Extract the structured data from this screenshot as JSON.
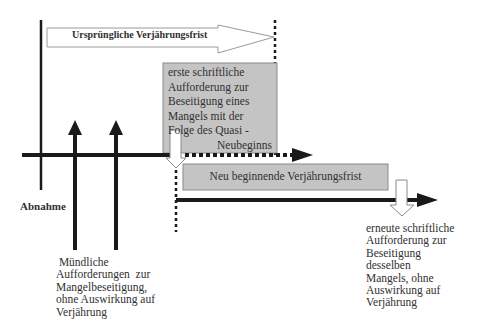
{
  "diagram": {
    "original_period": {
      "label": "Ursprüngliche Verjährungsfrist"
    },
    "first_written_request": {
      "lines": [
        "erste   schriftliche",
        "Aufforderung zur",
        "Beseitigung eines",
        "Mangels mit der",
        "Folge des Quasi -",
        "Neubeginns"
      ]
    },
    "new_period": {
      "label": "Neu beginnende Verjährungsfrist"
    },
    "acceptance": {
      "label": "Abnahme"
    },
    "oral_requests": {
      "lines": [
        " Mündliche",
        "Aufforderungen  zur",
        "Mangelbeseitigung,",
        "ohne Auswirkung auf",
        "Verjährung"
      ]
    },
    "repeated_written_request": {
      "lines": [
        "erneute schriftliche",
        "Aufforderung zur",
        "Beseitigung",
        "desselben",
        "Mangels, ohne",
        "Auswirkung auf",
        "Verjährung"
      ]
    },
    "colors": {
      "line": "#1a1a1a",
      "box_fill": "#c4c4c4",
      "box_border": "#8a8a8a",
      "hollow_arrow_stroke": "#9a9a9a"
    }
  }
}
